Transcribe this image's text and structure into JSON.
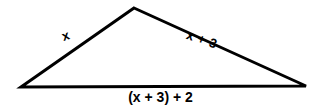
{
  "figure": {
    "type": "triangle-diagram",
    "background_color": "#ffffff",
    "stroke_color": "#000000",
    "stroke_width": 3,
    "vertices": {
      "apex": [
        134,
        8
      ],
      "bottom_left": [
        21,
        87
      ],
      "bottom_right": [
        306,
        86
      ]
    },
    "labels": {
      "left_side": "x",
      "right_side": "x + 3",
      "bottom_side": "(x + 3) + 2"
    }
  }
}
